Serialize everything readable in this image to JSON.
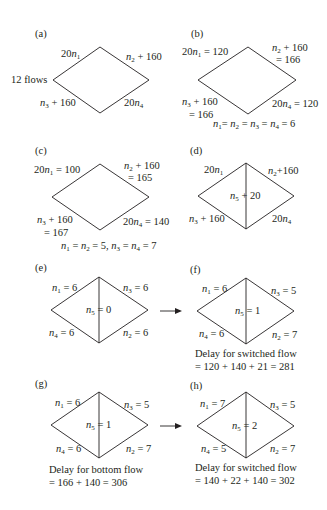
{
  "figure": {
    "stroke_color": "#231f20",
    "panels": [
      {
        "id": "a",
        "label": "(a)",
        "left_note": "12 flows",
        "edges": {
          "top_left": "20n1",
          "top_right": "n2 + 160",
          "bottom_left": "n3 + 160",
          "bottom_right": "20n4"
        }
      },
      {
        "id": "b",
        "label": "(b)",
        "edges": {
          "top_left": "20n1 = 120",
          "top_right": "n2 + 160 = 166",
          "bottom_left": "n3 + 160 = 166",
          "bottom_right": "20n4 = 120"
        },
        "caption": "n1 = n2 = n3 = n4 = 6"
      },
      {
        "id": "c",
        "label": "(c)",
        "edges": {
          "top_left": "20n1 = 100",
          "top_right": "n2 + 160 = 165",
          "bottom_left": "n3 + 160 = 167",
          "bottom_right": "20n4 = 140"
        },
        "caption": "n1 = n2 = 5, n3 = n4 = 7"
      },
      {
        "id": "d",
        "label": "(d)",
        "edges": {
          "top_left": "20n1",
          "top_right": "n2+160",
          "middle": "n5 + 20",
          "bottom_left": "n3 + 160",
          "bottom_right": "20n4"
        }
      },
      {
        "id": "e",
        "label": "(e)",
        "edges": {
          "top_left": "n1 = 6",
          "top_right": "n3 = 6",
          "middle": "n5 = 0",
          "bottom_left": "n4 = 6",
          "bottom_right": "n2 = 6"
        }
      },
      {
        "id": "f",
        "label": "(f)",
        "edges": {
          "top_left": "n1 = 6",
          "top_right": "n3 = 5",
          "middle": "n5 = 1",
          "bottom_left": "n4 = 6",
          "bottom_right": "n2 = 7"
        },
        "caption_line1": "Delay for switched flow",
        "caption_line2": "= 120 + 140 + 21 = 281"
      },
      {
        "id": "g",
        "label": "(g)",
        "edges": {
          "top_left": "n1 = 6",
          "top_right": "n3 = 5",
          "middle": "n5 = 1",
          "bottom_left": "n4 = 6",
          "bottom_right": "n2 = 7"
        },
        "caption_line1": "Delay for bottom flow",
        "caption_line2": "= 166 + 140 = 306"
      },
      {
        "id": "h",
        "label": "(h)",
        "edges": {
          "top_left": "n1 = 7",
          "top_right": "n3 = 5",
          "middle": "n5 = 2",
          "bottom_left": "n4 = 5",
          "bottom_right": "n2 = 7"
        },
        "caption_line1": "Delay for switched flow",
        "caption_line2": "= 140 + 22 + 140 = 302"
      }
    ],
    "arrows": [
      {
        "from": "e",
        "to": "f"
      },
      {
        "from": "g",
        "to": "h"
      }
    ]
  }
}
